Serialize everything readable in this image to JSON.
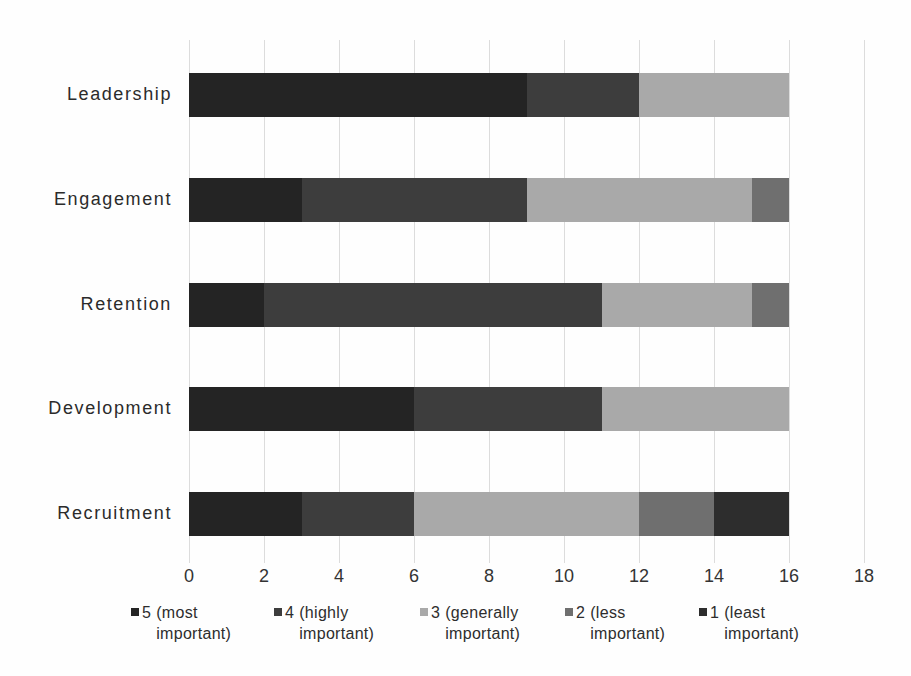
{
  "chart_data": {
    "type": "bar",
    "orientation": "horizontal",
    "stacked": true,
    "title": "",
    "xlabel": "",
    "ylabel": "",
    "categories": [
      "Leadership",
      "Engagement",
      "Retention",
      "Development",
      "Recruitment"
    ],
    "series": [
      {
        "name": "5 (most important)",
        "color": "#242424",
        "values": [
          9,
          3,
          2,
          6,
          3
        ]
      },
      {
        "name": "4 (highly important)",
        "color": "#3d3d3d",
        "values": [
          3,
          6,
          9,
          5,
          3
        ]
      },
      {
        "name": "3 (generally important)",
        "color": "#a9a9a9",
        "values": [
          4,
          6,
          4,
          5,
          6
        ]
      },
      {
        "name": "2 (less important)",
        "color": "#6f6f6f",
        "values": [
          0,
          1,
          1,
          0,
          2
        ]
      },
      {
        "name": "1 (least important)",
        "color": "#2d2d2d",
        "values": [
          0,
          0,
          0,
          0,
          2
        ]
      }
    ],
    "xlim": [
      0,
      18
    ],
    "xticks": [
      "0",
      "2",
      "4",
      "6",
      "8",
      "10",
      "12",
      "14",
      "16",
      "18"
    ],
    "grid": "vertical",
    "gridline_color": "#dcdcdc",
    "legend_position": "bottom"
  }
}
